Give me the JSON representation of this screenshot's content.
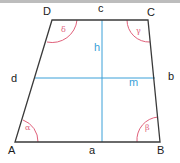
{
  "diagram": {
    "colors": {
      "outline": "#3a3a3a",
      "construction": "#3aa0d8",
      "angle_arcs": "#e0607a",
      "top_band": "#bdbdbd"
    },
    "vertices": {
      "A": "A",
      "B": "B",
      "C": "C",
      "D": "D"
    },
    "sides": {
      "a": "a",
      "b": "b",
      "c": "c",
      "d": "d"
    },
    "lines": {
      "height": "h",
      "midline": "m"
    },
    "angles": {
      "alpha": "α",
      "beta": "β",
      "gamma": "γ",
      "delta": "δ"
    }
  }
}
